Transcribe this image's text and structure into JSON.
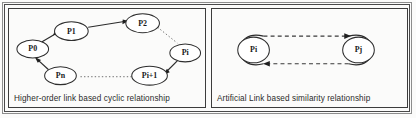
{
  "figure": {
    "panels": [
      {
        "id": "cyclic",
        "caption": "Higher-order link based cyclic relationship",
        "nodes": [
          {
            "id": "p0",
            "label": "P0",
            "cx": 24,
            "cy": 40
          },
          {
            "id": "p1",
            "label": "P1",
            "cx": 63,
            "cy": 22
          },
          {
            "id": "p2",
            "label": "P2",
            "cx": 135,
            "cy": 14
          },
          {
            "id": "pi",
            "label": "Pi",
            "cx": 178,
            "cy": 44
          },
          {
            "id": "pi1",
            "label": "Pi+1",
            "cx": 142,
            "cy": 67
          },
          {
            "id": "pn",
            "label": "Pn",
            "cx": 52,
            "cy": 67
          }
        ],
        "edges": [
          {
            "id": "pn-p0",
            "from": "Pn",
            "to": "P0",
            "style": "solid",
            "arrow": "forward"
          },
          {
            "id": "p0-p1",
            "from": "P0",
            "to": "P1",
            "style": "solid",
            "arrow": "forward"
          },
          {
            "id": "p1-p2",
            "from": "P1",
            "to": "P2",
            "style": "solid",
            "arrow": "forward"
          },
          {
            "id": "p2-pi",
            "from": "P2",
            "to": "Pi",
            "style": "dotted",
            "arrow": "none"
          },
          {
            "id": "pi-pi1",
            "from": "Pi",
            "to": "Pi+1",
            "style": "solid",
            "arrow": "forward"
          },
          {
            "id": "pi1-pn",
            "from": "Pi+1",
            "to": "Pn",
            "style": "dotted",
            "arrow": "none"
          }
        ]
      },
      {
        "id": "similarity",
        "caption": "Artificial Link based similarity relationship",
        "nodes": [
          {
            "id": "pi",
            "label": "Pi",
            "cx": 42,
            "cy": 41
          },
          {
            "id": "pj",
            "label": "Pj",
            "cx": 148,
            "cy": 41
          }
        ],
        "edges": [
          {
            "id": "pi-pj",
            "from": "Pi",
            "to": "Pj",
            "style": "dashed",
            "arrow": "forward"
          },
          {
            "id": "pj-pi",
            "from": "Pj",
            "to": "Pi",
            "style": "dashed",
            "arrow": "forward"
          }
        ]
      }
    ]
  }
}
